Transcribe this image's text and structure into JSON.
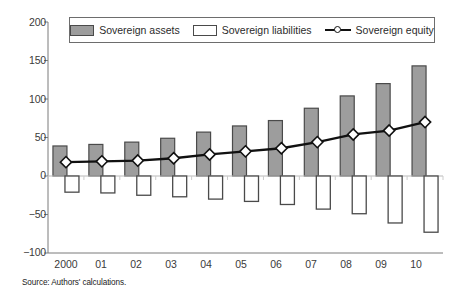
{
  "source_note": "Source: Authors' calculations.",
  "legend": {
    "position": "top-center",
    "items": [
      {
        "label": "Sovereign assets",
        "marker": "filled-gray-bar-swatch",
        "color": "#9d9d9d"
      },
      {
        "label": "Sovereign liabilities",
        "marker": "hollow-white-bar-swatch",
        "color": "#ffffff"
      },
      {
        "label": "Sovereign equity",
        "marker": "line-with-diamond-marker",
        "color": "#111111"
      }
    ]
  },
  "axes": {
    "y_ticks": [
      "200",
      "150",
      "100",
      "50",
      "0",
      "−50",
      "−100"
    ],
    "x_ticks": [
      "2000",
      "01",
      "02",
      "03",
      "04",
      "05",
      "06",
      "07",
      "08",
      "09",
      "10"
    ]
  },
  "chart_data": {
    "type": "bar",
    "title": "",
    "subtitle": "",
    "xlabel": "",
    "ylabel": "",
    "categories": [
      "2000",
      "01",
      "02",
      "03",
      "04",
      "05",
      "06",
      "07",
      "08",
      "09",
      "10"
    ],
    "ylim": [
      -100,
      200
    ],
    "yticks": [
      -100,
      -50,
      0,
      50,
      100,
      150,
      200
    ],
    "grid": false,
    "legend_position": "top-center",
    "series": [
      {
        "name": "Sovereign assets",
        "type": "bar",
        "fill": "#9d9d9d",
        "edge": "#4a4a4a",
        "values": [
          39,
          41,
          44,
          49,
          57,
          65,
          72,
          88,
          104,
          120,
          143
        ]
      },
      {
        "name": "Sovereign liabilities",
        "type": "bar",
        "fill": "#ffffff",
        "edge": "#4a4a4a",
        "values": [
          -21,
          -22,
          -25,
          -27,
          -30,
          -33,
          -37,
          -43,
          -49,
          -61,
          -73
        ]
      },
      {
        "name": "Sovereign equity",
        "type": "line",
        "fill": "#111111",
        "edge": "#111111",
        "marker": "diamond",
        "values": [
          18,
          19,
          20,
          23,
          28,
          32,
          36,
          44,
          54,
          59,
          70
        ]
      }
    ]
  }
}
